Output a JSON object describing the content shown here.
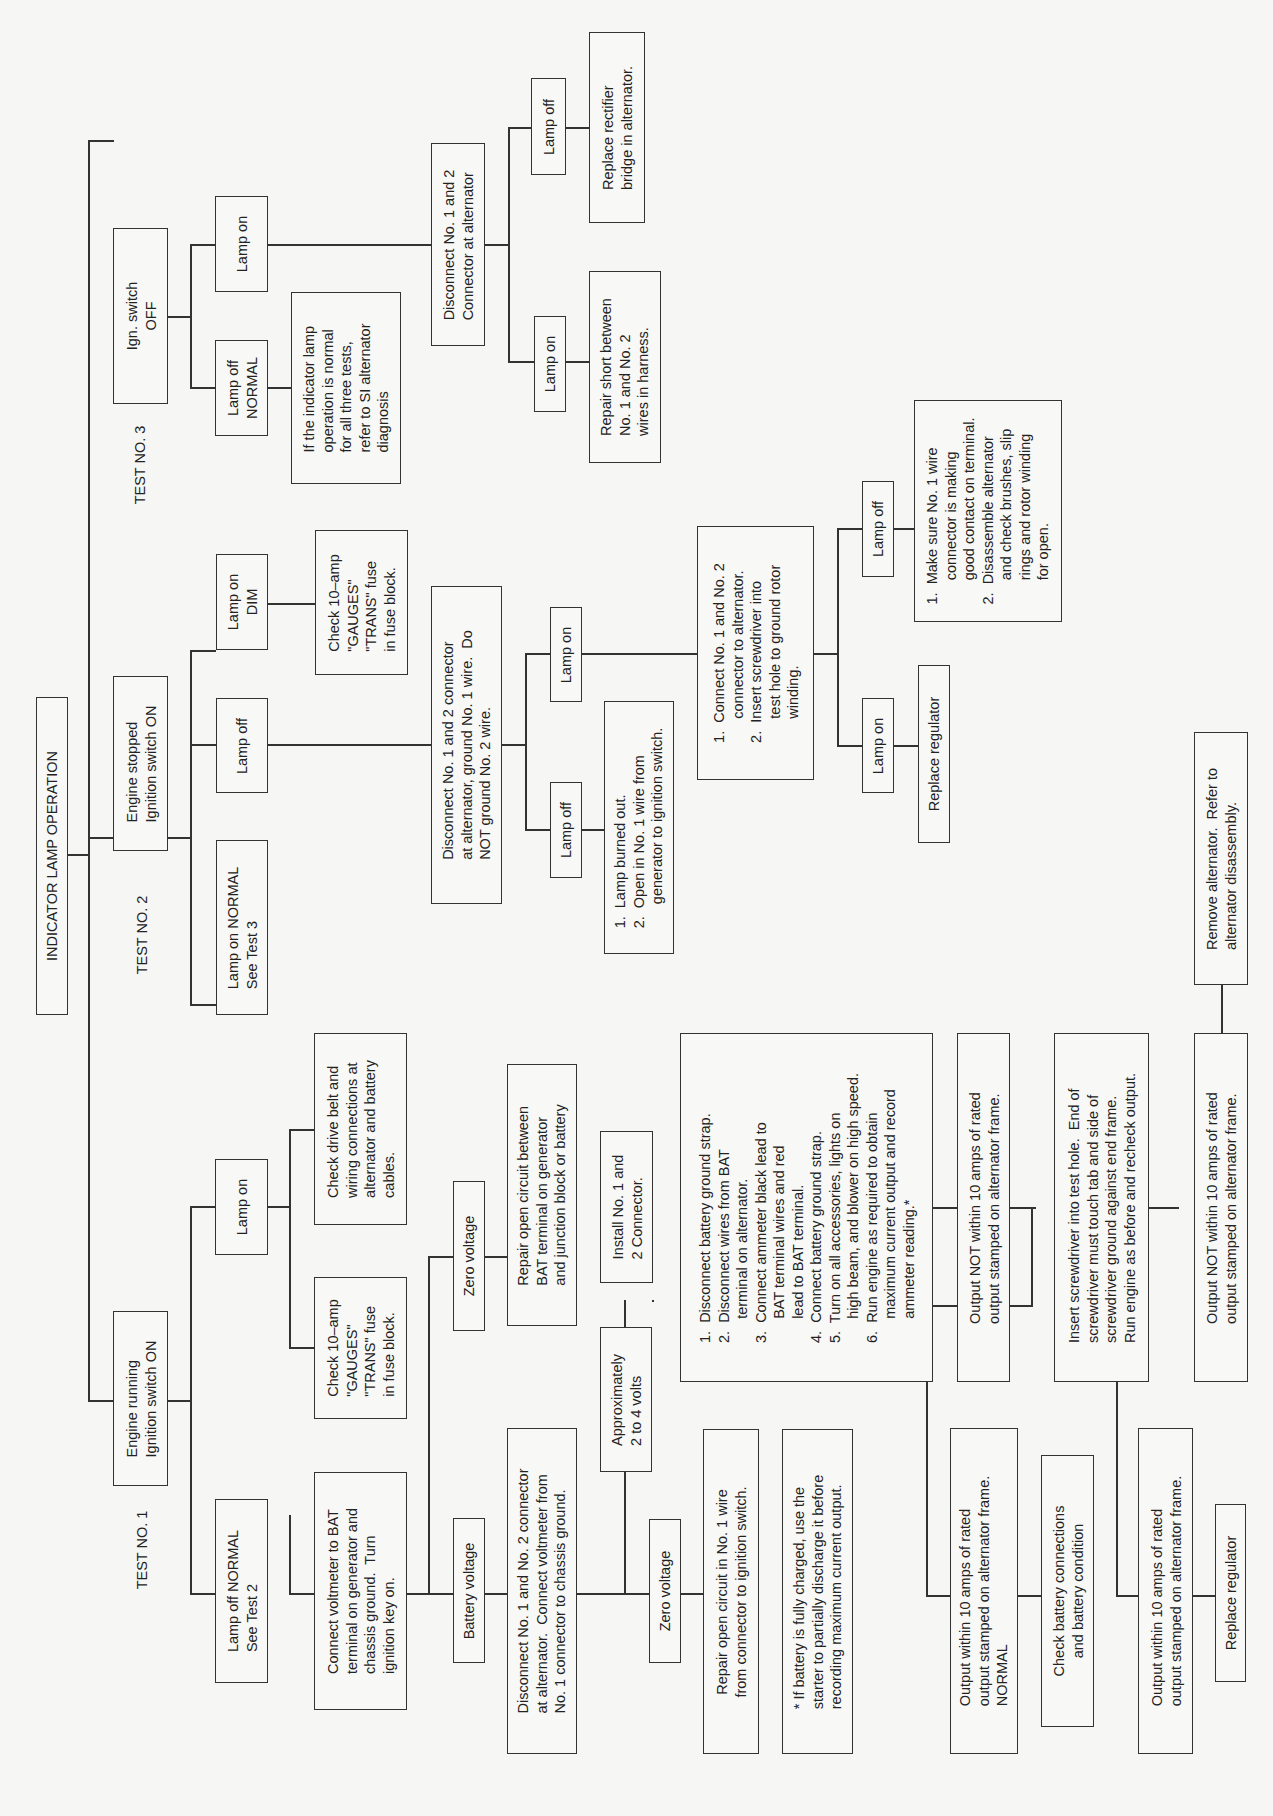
{
  "diagram": {
    "title": "INDICATOR LAMP OPERATION",
    "tests": [
      {
        "label": "TEST NO. 1",
        "condition": "Engine running\nIgnition switch ON",
        "lamp_off": "Lamp off NORMAL\nSee Test 2",
        "lamp_on": "Lamp on",
        "lamp_on_actions": [
          "Check 10–amp\n\"GAUGES\"\n\"TRANS\" fuse\nin fuse block.",
          "Check drive belt and\nwiring connections at\nalternator and battery\ncables."
        ],
        "voltmeter_step": "Connect voltmeter to BAT\nterminal on generator and\nchassis ground.  Turn\nignition key on.",
        "battery_voltage": "Battery voltage",
        "zero_voltage_1": "Zero voltage",
        "repair_bat_circuit": "Repair open circuit between\nBAT terminal on generator\nand junction block or battery",
        "disconnect_step": "Disconnect No. 1 and No. 2 connector\nat alternator.  Connect voltmeter from\nNo. 1 connector to chassis ground.",
        "approx_volts": "Approximately\n2 to 4 volts",
        "zero_voltage_2": "Zero voltage",
        "repair_no1_wire": "Repair open circuit in No. 1 wire\nfrom connector to ignition switch.",
        "install_connector": "Install No. 1 and\n2 Connector.",
        "ammeter_steps": "1.  Disconnect battery ground strap.\n2.  Disconnect wires from BAT\n      terminal on alternator.\n3.  Connect ammeter black lead to\n      BAT terminal wires and red\n      lead to BAT terminal.\n4.  Connect battery ground strap.\n5.  Turn on all accessories, lights on\n      high beam, and blower on high speed.\n6.  Run engine as required to obtain\n      maximum current output and record\n      ammeter reading.*",
        "footnote": "* If battery is fully charged, use the\nstarter to partially discharge it before\nrecording maximum current output.",
        "output_within_normal": "Output within 10 amps of rated\noutput stamped on alternator frame.\nNORMAL",
        "check_battery": "Check battery connections\nand battery condition",
        "output_not_within_1": "Output NOT within 10 amps of rated\noutput stamped on alternator frame.",
        "insert_screwdriver": "Insert screwdriver into test hole.  End of\nscrewdriver must touch tab and side of\nscrewdriver ground against end frame.\nRun engine as before and recheck output.",
        "output_within_2": "Output within 10 amps of rated\noutput stamped on alternator frame.",
        "replace_regulator": "Replace regulator",
        "output_not_within_2": "Output NOT within 10 amps of rated\noutput stamped on alternator frame.",
        "remove_alternator": "Remove alternator.  Refer to\nalternator disassembly."
      },
      {
        "label": "TEST NO. 2",
        "condition": "Engine stopped\nIgnition switch ON",
        "lamp_on_normal": "Lamp on NORMAL\nSee Test 3",
        "lamp_off": "Lamp off",
        "lamp_on_dim": "Lamp on\nDIM",
        "check_fuse": "Check 10–amp\n\"GAUGES\"\n\"TRANS\" fuse\nin fuse block.",
        "disconnect_step": "Disconnect No. 1 and 2 connector\nat alternator, ground No. 1 wire.  Do\nNOT ground No. 2 wire.",
        "sub_lamp_off": "Lamp off",
        "sub_lamp_off_causes": "1.  Lamp burned out.\n2.  Open in No. 1 wire from\n      generator to ignition switch.",
        "sub_lamp_on": "Lamp on",
        "connect_step": "1.  Connect No. 1 and No. 2\n      connector to alternator.\n2.  Insert screwdriver into\n      test hole to ground rotor\n      winding.",
        "final_lamp_on": "Lamp on",
        "replace_regulator": "Replace regulator",
        "final_lamp_off": "Lamp off",
        "final_lamp_off_actions": "1.  Make sure No. 1 wire\n      connector is making\n      good contact on terminal.\n2.  Disassemble alternator\n      and check brushes, slip\n      rings and rotor winding\n      for open."
      },
      {
        "label": "TEST NO. 3",
        "condition": "Ign. switch\nOFF",
        "lamp_off_normal": "Lamp off\nNORMAL",
        "normal_note": "If the indicator lamp\noperation is normal\nfor all three tests,\nrefer to SI alternator\ndiagnosis",
        "lamp_on": "Lamp on",
        "disconnect_step": "Disconnect No. 1 and 2\nConnector at alternator",
        "sub_lamp_on": "Lamp on",
        "repair_short": "Repair short between\nNo. 1 and No. 2\nwires in harness.",
        "sub_lamp_off": "Lamp off",
        "replace_rectifier": "Replace rectifier\nbridge in alternator."
      }
    ]
  }
}
